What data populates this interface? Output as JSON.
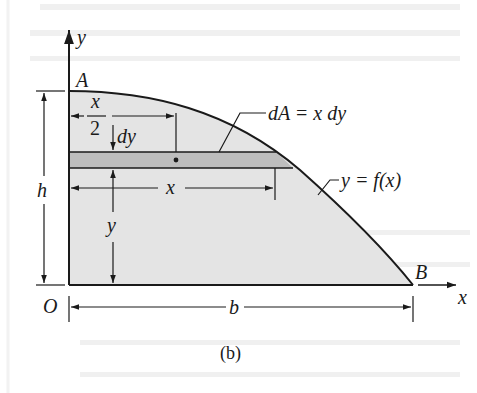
{
  "figure": {
    "caption": "(b)",
    "colors": {
      "region_fill": "#e4e4e4",
      "strip_fill": "#bdbdbd",
      "line": "#1a1a1a",
      "ghost_text": "#ededed"
    },
    "axes": {
      "x_label": "x",
      "y_label": "y",
      "origin_label": "O"
    },
    "points": {
      "A": "A",
      "B": "B"
    },
    "curve_label": "y = f(x)",
    "element_label": "dA = x dy",
    "dimensions": {
      "half_x": {
        "numerator": "x",
        "denominator": "2"
      },
      "dy": "dy",
      "x": "x",
      "y": "y",
      "h": "h",
      "b": "b"
    }
  }
}
